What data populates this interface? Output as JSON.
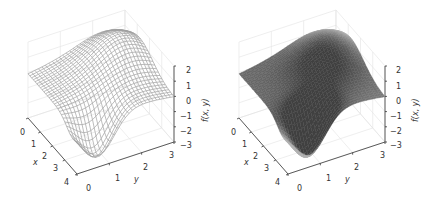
{
  "chart_data": [
    {
      "type": "surface-wireframe",
      "title": "",
      "xlabel": "x",
      "ylabel": "y",
      "zlabel": "f(x, y)",
      "x_ticks": [
        "0",
        "1",
        "2",
        "3",
        "4"
      ],
      "y_ticks": [
        "0",
        "1",
        "2",
        "3"
      ],
      "z_ticks": [
        "2",
        "1",
        "0",
        "−1",
        "−2",
        "−3"
      ],
      "xlim": [
        0,
        4
      ],
      "ylim": [
        0,
        3
      ],
      "zlim": [
        -3,
        2
      ],
      "grid": true,
      "surface_color": "#a0a0a0",
      "description": "Smooth surface with a ridge near high y / low x (max about 1.8) and a deep valley near x=4, y=0.5 (min about -2.6)"
    },
    {
      "type": "surface-shaded",
      "title": "",
      "xlabel": "x",
      "ylabel": "y",
      "zlabel": "f(x, y)",
      "x_ticks": [
        "0",
        "1",
        "2",
        "3",
        "4"
      ],
      "y_ticks": [
        "0",
        "1",
        "2",
        "3"
      ],
      "z_ticks": [
        "2",
        "1",
        "0",
        "−1",
        "−2",
        "−3"
      ],
      "xlim": [
        0,
        4
      ],
      "ylim": [
        0,
        3
      ],
      "zlim": [
        -3,
        2
      ],
      "grid": true,
      "surface_color": "#6a6a6a",
      "description": "Same function rendered as a shaded gray surface"
    }
  ]
}
